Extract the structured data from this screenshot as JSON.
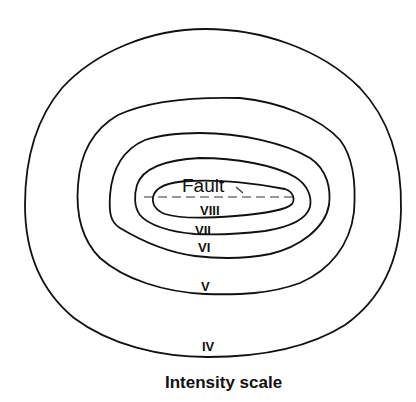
{
  "diagram": {
    "caption": "Intensity scale",
    "fault_label": "Fault",
    "isoseismals": [
      {
        "label": "IV"
      },
      {
        "label": "V"
      },
      {
        "label": "VI"
      },
      {
        "label": "VII"
      },
      {
        "label": "VIII"
      }
    ]
  }
}
